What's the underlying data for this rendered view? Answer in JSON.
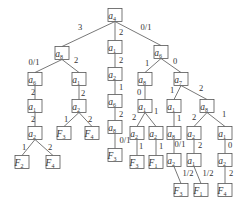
{
  "diagram": {
    "type": "decision-tree",
    "colors": {
      "line": "#555555",
      "text": "#333333",
      "background": "#ffffff"
    },
    "nodes": [
      {
        "id": "n0",
        "var": "a",
        "sub": "4",
        "x": 115,
        "y": 15
      },
      {
        "id": "n1",
        "var": "a",
        "sub": "8",
        "x": 62,
        "y": 53
      },
      {
        "id": "n2",
        "var": "a",
        "sub": "1",
        "x": 115,
        "y": 47
      },
      {
        "id": "n3",
        "var": "a",
        "sub": "6",
        "x": 161,
        "y": 52
      },
      {
        "id": "n4",
        "var": "a",
        "sub": "6",
        "x": 35,
        "y": 79
      },
      {
        "id": "n5",
        "var": "a",
        "sub": "1",
        "x": 79,
        "y": 79
      },
      {
        "id": "n6",
        "var": "a",
        "sub": "1",
        "x": 35,
        "y": 106
      },
      {
        "id": "n7",
        "var": "a",
        "sub": "2",
        "x": 35,
        "y": 133
      },
      {
        "id": "n8",
        "var": "F",
        "sub": "2",
        "x": 22,
        "y": 162
      },
      {
        "id": "n9",
        "var": "F",
        "sub": "4",
        "x": 53,
        "y": 162
      },
      {
        "id": "n10",
        "var": "a",
        "sub": "2",
        "x": 79,
        "y": 106
      },
      {
        "id": "n11",
        "var": "F",
        "sub": "3",
        "x": 64,
        "y": 133
      },
      {
        "id": "n12",
        "var": "F",
        "sub": "4",
        "x": 92,
        "y": 133
      },
      {
        "id": "n13",
        "var": "a",
        "sub": "2",
        "x": 115,
        "y": 74
      },
      {
        "id": "n14",
        "var": "a",
        "sub": "6",
        "x": 115,
        "y": 101
      },
      {
        "id": "n15",
        "var": "a",
        "sub": "8",
        "x": 115,
        "y": 127
      },
      {
        "id": "n16",
        "var": "F",
        "sub": "3",
        "x": 115,
        "y": 155
      },
      {
        "id": "n17",
        "var": "a",
        "sub": "8",
        "x": 145,
        "y": 79
      },
      {
        "id": "n18",
        "var": "a",
        "sub": "7",
        "x": 181,
        "y": 79
      },
      {
        "id": "n19",
        "var": "a",
        "sub": "1",
        "x": 145,
        "y": 106
      },
      {
        "id": "n20",
        "var": "a",
        "sub": "2",
        "x": 137,
        "y": 133
      },
      {
        "id": "n21",
        "var": "F",
        "sub": "3",
        "x": 137,
        "y": 162
      },
      {
        "id": "n22",
        "var": "a",
        "sub": "2",
        "x": 156,
        "y": 133
      },
      {
        "id": "n23",
        "var": "F",
        "sub": "1",
        "x": 156,
        "y": 162
      },
      {
        "id": "n24",
        "var": "a",
        "sub": "1",
        "x": 174,
        "y": 106
      },
      {
        "id": "n25",
        "var": "a",
        "sub": "8",
        "x": 174,
        "y": 133
      },
      {
        "id": "n26",
        "var": "a",
        "sub": "2",
        "x": 174,
        "y": 160
      },
      {
        "id": "n27",
        "var": "F",
        "sub": "3",
        "x": 181,
        "y": 190
      },
      {
        "id": "n28",
        "var": "a",
        "sub": "8",
        "x": 207,
        "y": 106
      },
      {
        "id": "n29",
        "var": "a",
        "sub": "2",
        "x": 194,
        "y": 133
      },
      {
        "id": "n30",
        "var": "a",
        "sub": "1",
        "x": 194,
        "y": 160
      },
      {
        "id": "n31",
        "var": "F",
        "sub": "1",
        "x": 201,
        "y": 190
      },
      {
        "id": "n32",
        "var": "a",
        "sub": "1",
        "x": 225,
        "y": 133
      },
      {
        "id": "n33",
        "var": "a",
        "sub": "2",
        "x": 225,
        "y": 160
      },
      {
        "id": "n34",
        "var": "F",
        "sub": "4",
        "x": 225,
        "y": 190
      }
    ],
    "edges": [
      {
        "from": "n0",
        "to": "n1",
        "label": "3",
        "lx": 80,
        "ly": 30
      },
      {
        "from": "n0",
        "to": "n2",
        "label": "2",
        "lx": 121,
        "ly": 35
      },
      {
        "from": "n0",
        "to": "n3",
        "label": "0/1",
        "lx": 146,
        "ly": 30
      },
      {
        "from": "n1",
        "to": "n4",
        "label": "0/1",
        "lx": 34,
        "ly": 65
      },
      {
        "from": "n1",
        "to": "n5",
        "label": "2",
        "lx": 76,
        "ly": 63
      },
      {
        "from": "n4",
        "to": "n6",
        "label": "2",
        "lx": 33,
        "ly": 95
      },
      {
        "from": "n6",
        "to": "n7",
        "label": "2",
        "lx": 33,
        "ly": 122
      },
      {
        "from": "n7",
        "to": "n8",
        "label": "1",
        "lx": 24,
        "ly": 150
      },
      {
        "from": "n7",
        "to": "n9",
        "label": "2",
        "lx": 50,
        "ly": 150
      },
      {
        "from": "n5",
        "to": "n10",
        "label": "2",
        "lx": 83,
        "ly": 96
      },
      {
        "from": "n10",
        "to": "n11",
        "label": "1",
        "lx": 66,
        "ly": 122
      },
      {
        "from": "n10",
        "to": "n12",
        "label": "2",
        "lx": 90,
        "ly": 122
      },
      {
        "from": "n2",
        "to": "n13",
        "label": "2",
        "lx": 121,
        "ly": 63
      },
      {
        "from": "n13",
        "to": "n14",
        "label": "1",
        "lx": 121,
        "ly": 90
      },
      {
        "from": "n14",
        "to": "n15",
        "label": "2",
        "lx": 121,
        "ly": 117
      },
      {
        "from": "n15",
        "to": "n16",
        "label": "0/1",
        "lx": 125,
        "ly": 143
      },
      {
        "from": "n3",
        "to": "n17",
        "label": "1",
        "lx": 147,
        "ly": 66
      },
      {
        "from": "n3",
        "to": "n18",
        "label": "0",
        "lx": 175,
        "ly": 64
      },
      {
        "from": "n17",
        "to": "n19",
        "label": "0",
        "lx": 139,
        "ly": 95
      },
      {
        "from": "n19",
        "to": "n20",
        "label": "2",
        "lx": 134,
        "ly": 120
      },
      {
        "from": "n19",
        "to": "n21",
        "label": "",
        "lx": 0,
        "ly": 0,
        "skip": true
      },
      {
        "from": "n20",
        "to": "n21",
        "label": "1",
        "lx": 141,
        "ly": 149
      },
      {
        "from": "n19",
        "to": "n22",
        "label": "1",
        "lx": 156,
        "ly": 114
      },
      {
        "from": "n22",
        "to": "n23",
        "label": "1",
        "lx": 161,
        "ly": 149
      },
      {
        "from": "n18",
        "to": "n24",
        "label": "1",
        "lx": 172,
        "ly": 93
      },
      {
        "from": "n24",
        "to": "n25",
        "label": "1",
        "lx": 179,
        "ly": 121
      },
      {
        "from": "n25",
        "to": "n26",
        "label": "0/1",
        "lx": 180,
        "ly": 147
      },
      {
        "from": "n26",
        "to": "n27",
        "label": "1/2",
        "lx": 188,
        "ly": 176
      },
      {
        "from": "n18",
        "to": "n28",
        "label": "2",
        "lx": 201,
        "ly": 91
      },
      {
        "from": "n28",
        "to": "n29",
        "label": "2",
        "lx": 194,
        "ly": 120
      },
      {
        "from": "n29",
        "to": "n30",
        "label": "2",
        "lx": 200,
        "ly": 148
      },
      {
        "from": "n30",
        "to": "n31",
        "label": "1/2",
        "lx": 208,
        "ly": 176
      },
      {
        "from": "n28",
        "to": "n32",
        "label": "1",
        "lx": 224,
        "ly": 117
      },
      {
        "from": "n32",
        "to": "n33",
        "label": "0",
        "lx": 230,
        "ly": 148
      },
      {
        "from": "n33",
        "to": "n34",
        "label": "2",
        "lx": 231,
        "ly": 176
      }
    ]
  }
}
